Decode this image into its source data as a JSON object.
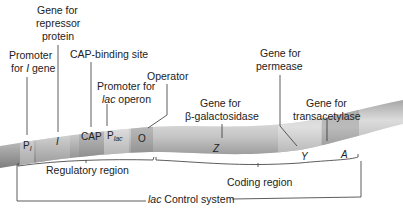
{
  "diagram": {
    "title": "lac operon",
    "top_labels": {
      "promoter_i": {
        "line1": "Promoter",
        "line2_pre": "for ",
        "line2_ital": "I",
        "line2_post": " gene"
      },
      "repressor": {
        "line1": "Gene for",
        "line2": "repressor",
        "line3": "protein"
      },
      "cap_site": {
        "line1": "CAP-binding site"
      },
      "promoter_lac": {
        "line1": "Promoter for",
        "line2_ital": "lac",
        "line2_post": " operon"
      },
      "operator": {
        "line1": "Operator"
      },
      "galactosidase": {
        "line1": "Gene for",
        "line2": "β-galactosidase"
      },
      "permease": {
        "line1": "Gene for",
        "line2": "permease"
      },
      "transacetylase": {
        "line1": "Gene for",
        "line2": "transacetylase"
      }
    },
    "segments": {
      "p_i": {
        "main": "P",
        "sub": "I"
      },
      "i": "I",
      "cap": "CAP",
      "p_lac": {
        "main": "P",
        "sub": "lac"
      },
      "o": "O",
      "z": "Z",
      "y": "Y",
      "a": "A"
    },
    "brackets": {
      "regulatory": "Regulatory region",
      "coding": "Coding region",
      "control_ital": "lac",
      "control_rest": " Control system"
    },
    "colors": {
      "dna_light": "#d8d8d8",
      "dna_mid": "#b4b4b4",
      "dna_dark": "#8a8a8a",
      "segment_light": "#c9c9c9",
      "segment_dark": "#9a9a9a",
      "line": "#333333",
      "text": "#222222"
    }
  }
}
